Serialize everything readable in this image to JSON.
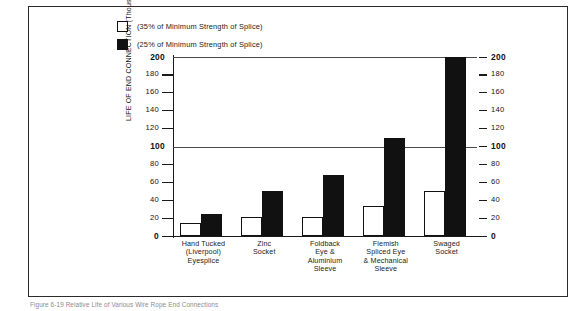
{
  "figure": {
    "caption": "Figure 6-19   Relative Life of Various Wire Rope End Connections"
  },
  "legend": {
    "position": "top-left",
    "items": [
      {
        "label": "(35% of Minimum Strength of Splice)",
        "swatch": "open-square-icon",
        "fill": "#ffffff"
      },
      {
        "label": "(25% of Minimum Strength of Splice)",
        "swatch": "filled-square-icon",
        "fill": "#111111"
      }
    ]
  },
  "chart_data": {
    "type": "bar",
    "title": "",
    "xlabel": "",
    "ylabel": "LIFE OF END CONNECTION (Thousands of Cycles to Failure)",
    "ylim": [
      0,
      200
    ],
    "grid": true,
    "gridlines": [
      100,
      200
    ],
    "yticks": [
      0,
      20,
      40,
      60,
      80,
      100,
      120,
      140,
      160,
      180,
      200
    ],
    "ytick_labels": [
      "0",
      "20",
      "40",
      "60",
      "80",
      "100",
      "120",
      "140",
      "160",
      "180",
      "200"
    ],
    "right_axis_yticks": [
      0,
      20,
      40,
      60,
      80,
      100,
      120,
      140,
      160,
      180,
      200
    ],
    "right_axis_ytick_labels": [
      "0",
      "20",
      "40",
      "60",
      "80",
      "100",
      "120",
      "140",
      "160",
      "180",
      "200"
    ],
    "categories": [
      "Hand Tucked\n(Liverpool)\nEyesplice",
      "Zinc\nSocket",
      "Foldback\nEye &\nAluminium\nSleeve",
      "Flemish\nSpliced Eye\n& Mechanical\nSleeve",
      "Swaged\nSocket"
    ],
    "series": [
      {
        "name": "(35% of Minimum Strength of Splice)",
        "fill": "#ffffff",
        "values": [
          15,
          21,
          21,
          33,
          50
        ]
      },
      {
        "name": "(25% of Minimum Strength of Splice)",
        "fill": "#111111",
        "values": [
          25,
          50,
          68,
          110,
          200
        ]
      }
    ]
  },
  "colors": {
    "frame": "#2b2b2b",
    "axis": "#1a1a1a",
    "grid": "#4a4a4a",
    "text": "#111111",
    "open_bar": "#ffffff",
    "filled_bar": "#111111"
  }
}
